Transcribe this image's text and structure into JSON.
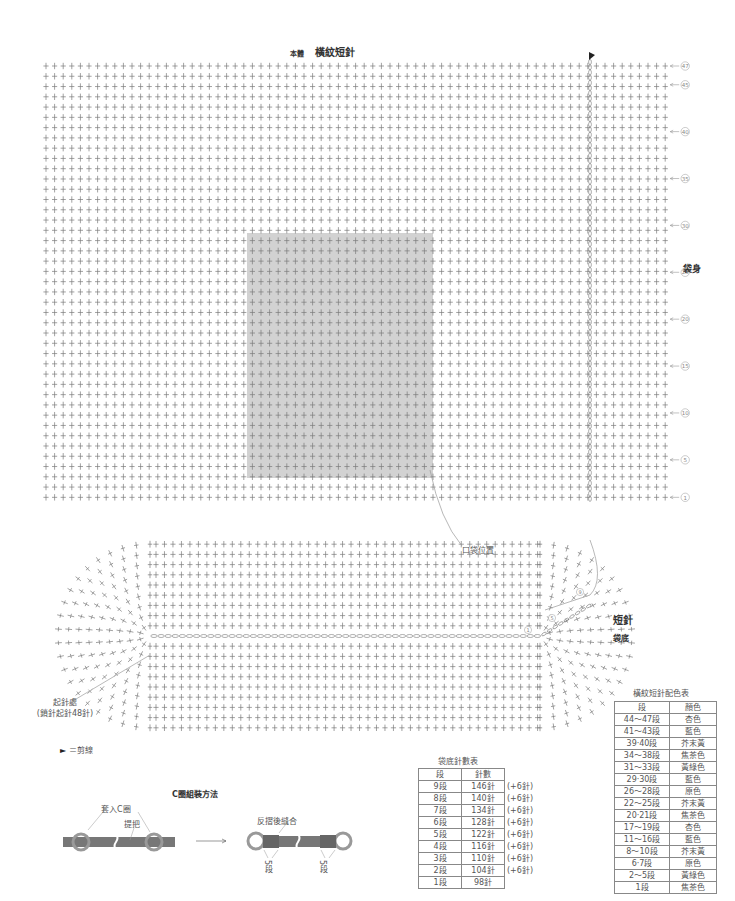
{
  "title": {
    "part": "本體",
    "stitch": "橫紋短針"
  },
  "body_chart": {
    "section_label": "袋身",
    "grid": {
      "cols": 73,
      "rows": 43,
      "x0": 46,
      "y0": 66,
      "dx": 8.6,
      "dy": 10.27,
      "color": "#7a7a7a"
    },
    "slip_stitch_col_x": 590,
    "cut_marker": "►",
    "row_markers": [
      {
        "label": "47",
        "row": 47
      },
      {
        "label": "45",
        "row": 45
      },
      {
        "label": "40",
        "row": 40
      },
      {
        "label": "35",
        "row": 35
      },
      {
        "label": "30",
        "row": 30
      },
      {
        "label": "25",
        "row": 25
      },
      {
        "label": "20",
        "row": 20
      },
      {
        "label": "15",
        "row": 15
      },
      {
        "label": "10",
        "row": 10
      },
      {
        "label": "5",
        "row": 5
      },
      {
        "label": "1",
        "row": 1
      }
    ],
    "pocket_area": {
      "x": 247,
      "y": 233,
      "w": 186,
      "h": 245,
      "color": "#d2d2d2"
    },
    "pocket_label": "口袋位置"
  },
  "base_chart": {
    "stitch_label": "短針",
    "section_label": "袋底",
    "start_note_line1": "起針處",
    "start_note_line2": "(鎖針起針48針)",
    "round_markers": [
      "1",
      "5",
      "9"
    ]
  },
  "legend": {
    "cut_symbol": "►",
    "cut_text": "＝剪線"
  },
  "assembly": {
    "title": "C圈組裝方法",
    "label_ring": "套入C圈",
    "label_handle": "提把",
    "label_fold": "反摺後縫合",
    "label_rows_left": "5段",
    "label_rows_right": "5段",
    "handle_color": "#777777",
    "ring_color": "#999999"
  },
  "base_stitch_table": {
    "title": "袋底針數表",
    "headers": [
      "段",
      "針數"
    ],
    "rows": [
      {
        "round": "9段",
        "count": "146針",
        "inc": "(+6針)"
      },
      {
        "round": "8段",
        "count": "140針",
        "inc": "(+6針)"
      },
      {
        "round": "7段",
        "count": "134針",
        "inc": "(+6針)"
      },
      {
        "round": "6段",
        "count": "128針",
        "inc": "(+6針)"
      },
      {
        "round": "5段",
        "count": "122針",
        "inc": "(+6針)"
      },
      {
        "round": "4段",
        "count": "116針",
        "inc": "(+6針)"
      },
      {
        "round": "3段",
        "count": "110針",
        "inc": "(+6針)"
      },
      {
        "round": "2段",
        "count": "104針",
        "inc": "(+6針)"
      },
      {
        "round": "1段",
        "count": "98針",
        "inc": ""
      }
    ]
  },
  "color_table": {
    "title": "橫紋短針配色表",
    "headers": [
      "段",
      "顏色"
    ],
    "rows": [
      {
        "rows": "44～47段",
        "color": "杏色"
      },
      {
        "rows": "41～43段",
        "color": "藍色"
      },
      {
        "rows": "39‧40段",
        "color": "芥末黃"
      },
      {
        "rows": "34～38段",
        "color": "焦茶色"
      },
      {
        "rows": "31～33段",
        "color": "黃綠色"
      },
      {
        "rows": "29‧30段",
        "color": "藍色"
      },
      {
        "rows": "26～28段",
        "color": "原色"
      },
      {
        "rows": "22～25段",
        "color": "芥末黃"
      },
      {
        "rows": "20‧21段",
        "color": "焦茶色"
      },
      {
        "rows": "17～19段",
        "color": "杏色"
      },
      {
        "rows": "11～16段",
        "color": "藍色"
      },
      {
        "rows": "8～10段",
        "color": "芥末黃"
      },
      {
        "rows": "6‧7段",
        "color": "原色"
      },
      {
        "rows": "2～5段",
        "color": "黃綠色"
      },
      {
        "rows": "1段",
        "color": "焦茶色"
      }
    ]
  }
}
